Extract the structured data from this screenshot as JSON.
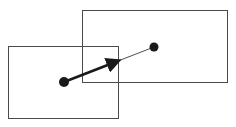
{
  "diagram": {
    "background": "#ffffff",
    "stroke_color": "#3a3a3a",
    "dot_color": "#1a1a1a",
    "rect_left": {
      "x": 8.5,
      "y": 46.5,
      "width": 110,
      "height": 72
    },
    "rect_right": {
      "x": 82.5,
      "y": 10.5,
      "width": 145,
      "height": 72
    },
    "point_start": {
      "cx": 64,
      "cy": 82,
      "r": 5
    },
    "point_end": {
      "cx": 154,
      "cy": 47,
      "r": 4.5
    },
    "thin_line": {
      "x1": 64,
      "y1": 82,
      "x2": 154,
      "y2": 47
    },
    "arrow": {
      "x1": 64,
      "y1": 82,
      "x2": 118,
      "y2": 61
    }
  }
}
